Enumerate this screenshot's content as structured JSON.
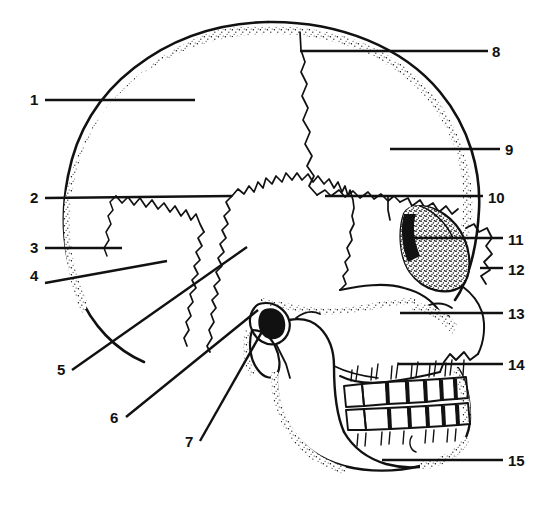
{
  "figure": {
    "width": 554,
    "height": 526,
    "background_color": "#ffffff",
    "ink_color": "#111111",
    "style": "black-and-white stippled line art"
  },
  "labels": [
    {
      "id": "1",
      "text": "1",
      "side": "left",
      "num_x": 30,
      "num_y": 92,
      "line": {
        "x1": 45,
        "y1": 100,
        "x2": 195,
        "y2": 100
      },
      "orientation": "horizontal"
    },
    {
      "id": "2",
      "text": "2",
      "side": "left",
      "num_x": 30,
      "num_y": 190,
      "line": {
        "x1": 45,
        "y1": 198,
        "x2": 232,
        "y2": 196
      },
      "orientation": "horizontal"
    },
    {
      "id": "3",
      "text": "3",
      "side": "left",
      "num_x": 30,
      "num_y": 240,
      "line": {
        "x1": 45,
        "y1": 248,
        "x2": 122,
        "y2": 248
      },
      "orientation": "horizontal"
    },
    {
      "id": "4",
      "text": "4",
      "side": "left",
      "num_x": 30,
      "num_y": 268,
      "line": {
        "x1": 45,
        "y1": 283,
        "x2": 167,
        "y2": 261
      },
      "orientation": "diagonal"
    },
    {
      "id": "5",
      "text": "5",
      "side": "left",
      "num_x": 57,
      "num_y": 362,
      "line": {
        "x1": 72,
        "y1": 370,
        "x2": 247,
        "y2": 247
      },
      "orientation": "diagonal"
    },
    {
      "id": "6",
      "text": "6",
      "side": "left",
      "num_x": 110,
      "num_y": 410,
      "line": {
        "x1": 126,
        "y1": 417,
        "x2": 258,
        "y2": 310
      },
      "orientation": "diagonal"
    },
    {
      "id": "7",
      "text": "7",
      "side": "left",
      "num_x": 185,
      "num_y": 434,
      "line": {
        "x1": 200,
        "y1": 441,
        "x2": 272,
        "y2": 314
      },
      "orientation": "diagonal"
    },
    {
      "id": "8",
      "text": "8",
      "side": "right",
      "num_x": 492,
      "num_y": 44,
      "line": {
        "x1": 300,
        "y1": 51,
        "x2": 488,
        "y2": 51
      },
      "orientation": "horizontal"
    },
    {
      "id": "9",
      "text": "9",
      "side": "right",
      "num_x": 505,
      "num_y": 142,
      "line": {
        "x1": 390,
        "y1": 149,
        "x2": 500,
        "y2": 149
      },
      "orientation": "horizontal"
    },
    {
      "id": "10",
      "text": "10",
      "side": "right",
      "num_x": 488,
      "num_y": 190,
      "line": {
        "x1": 325,
        "y1": 196,
        "x2": 483,
        "y2": 196
      },
      "orientation": "horizontal"
    },
    {
      "id": "11",
      "text": "11",
      "side": "right",
      "num_x": 508,
      "num_y": 232,
      "line": {
        "x1": 410,
        "y1": 238,
        "x2": 503,
        "y2": 238
      },
      "orientation": "horizontal"
    },
    {
      "id": "12",
      "text": "12",
      "side": "right",
      "num_x": 508,
      "num_y": 262,
      "line": {
        "x1": 480,
        "y1": 268,
        "x2": 503,
        "y2": 268
      },
      "orientation": "horizontal"
    },
    {
      "id": "13",
      "text": "13",
      "side": "right",
      "num_x": 508,
      "num_y": 306,
      "line": {
        "x1": 400,
        "y1": 313,
        "x2": 503,
        "y2": 313
      },
      "orientation": "horizontal"
    },
    {
      "id": "14",
      "text": "14",
      "side": "right",
      "num_x": 508,
      "num_y": 357,
      "line": {
        "x1": 398,
        "y1": 364,
        "x2": 503,
        "y2": 364
      },
      "orientation": "horizontal"
    },
    {
      "id": "15",
      "text": "15",
      "side": "right",
      "num_x": 508,
      "num_y": 453,
      "line": {
        "x1": 382,
        "y1": 460,
        "x2": 503,
        "y2": 460
      },
      "orientation": "horizontal"
    }
  ],
  "label_count": 15
}
